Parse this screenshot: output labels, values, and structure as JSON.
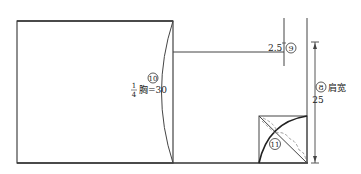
{
  "diagram": {
    "type": "pattern-draft",
    "labels": {
      "chest": {
        "marker": "⑩",
        "fraction_num": "1",
        "fraction_den": "4",
        "text": "胸=30"
      },
      "shoulder_drop": {
        "value": "2.5",
        "marker": "⑨"
      },
      "shoulder_width": {
        "marker": "⑧",
        "text": "肩宽",
        "value": "25"
      },
      "armhole": {
        "marker": "⑪"
      }
    },
    "colors": {
      "line": "#333333",
      "dashed": "#888888",
      "background": "#ffffff"
    }
  }
}
